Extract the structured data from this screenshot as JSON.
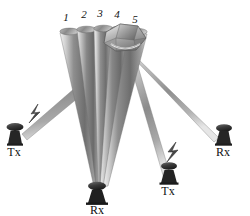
{
  "figure": {
    "background_color": "#ffffff",
    "beam_color_light": "#e8e8e8",
    "beam_color_mid": "#9a9a9a",
    "beam_color_dark": "#5f5f5f",
    "antenna_color": "#2a2a2a",
    "label_color": "#111111"
  },
  "beam_labels": [
    {
      "id": "beam-1",
      "text": "1",
      "x": 66,
      "y": 21
    },
    {
      "id": "beam-2",
      "text": "2",
      "x": 83,
      "y": 18
    },
    {
      "id": "beam-3",
      "text": "3",
      "x": 99,
      "y": 17
    },
    {
      "id": "beam-4",
      "text": "4",
      "x": 115,
      "y": 18
    },
    {
      "id": "beam-5",
      "text": "5",
      "x": 133,
      "y": 23
    }
  ],
  "stations": [
    {
      "id": "tx-left",
      "label": "Tx",
      "x": 14,
      "y": 152,
      "role": "transmitter",
      "has_lightning": true
    },
    {
      "id": "rx-bottom",
      "label": "Rx",
      "x": 88,
      "y": 211,
      "role": "receiver",
      "has_lightning": false
    },
    {
      "id": "tx-bottom",
      "label": "Tx",
      "x": 166,
      "y": 199,
      "role": "transmitter",
      "has_lightning": true
    },
    {
      "id": "rx-right",
      "label": "Rx",
      "x": 222,
      "y": 153,
      "role": "receiver",
      "has_lightning": false
    }
  ],
  "target": {
    "id": "target-polyhedron",
    "name": "target-object",
    "near_beam": "5"
  },
  "counts": {
    "beams": 5,
    "transmitters": 2,
    "receivers": 2
  }
}
